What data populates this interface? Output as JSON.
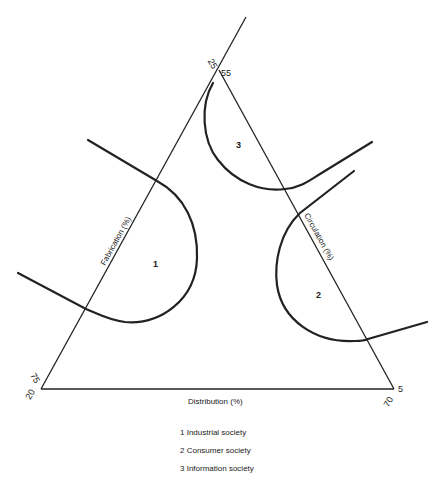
{
  "diagram": {
    "type": "ternary",
    "axes": {
      "fabrication": "Fabrication (%)",
      "circulation": "Circulation (%)",
      "distribution": "Distribution (%)"
    },
    "ticks": {
      "apex_left": "25",
      "apex_right": "55",
      "bottom_left_upper": "75",
      "bottom_left_lower": "20",
      "bottom_right_upper": "5",
      "bottom_right_lower": "70"
    },
    "regions": [
      {
        "id": "1",
        "label": "1"
      },
      {
        "id": "2",
        "label": "2"
      },
      {
        "id": "3",
        "label": "3"
      }
    ]
  },
  "legend": {
    "items": [
      {
        "text": "1 Industrial society"
      },
      {
        "text": "2 Consumer society"
      },
      {
        "text": "3 Information society"
      }
    ]
  }
}
